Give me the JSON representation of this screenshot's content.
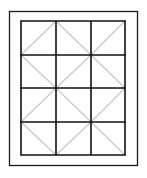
{
  "diagram": {
    "title": "",
    "outer_frame": {
      "x": 9,
      "y": 11,
      "w": 128,
      "h": 154
    },
    "grid": {
      "x": 21,
      "y": 21,
      "w": 104,
      "h": 134,
      "columns": 3,
      "rows": 4,
      "col_lines": [
        21,
        56,
        91,
        125
      ],
      "row_lines": [
        21,
        55,
        88,
        122,
        155
      ]
    },
    "diagonals": [
      {
        "x1": 21,
        "y1": 55,
        "x2": 56,
        "y2": 21
      },
      {
        "x1": 56,
        "y1": 21,
        "x2": 91,
        "y2": 55
      },
      {
        "x1": 91,
        "y1": 55,
        "x2": 125,
        "y2": 21
      },
      {
        "x1": 21,
        "y1": 55,
        "x2": 56,
        "y2": 88
      },
      {
        "x1": 56,
        "y1": 88,
        "x2": 91,
        "y2": 55
      },
      {
        "x1": 91,
        "y1": 55,
        "x2": 125,
        "y2": 88
      },
      {
        "x1": 21,
        "y1": 122,
        "x2": 56,
        "y2": 88
      },
      {
        "x1": 56,
        "y1": 88,
        "x2": 91,
        "y2": 122
      },
      {
        "x1": 91,
        "y1": 122,
        "x2": 125,
        "y2": 88
      },
      {
        "x1": 21,
        "y1": 122,
        "x2": 56,
        "y2": 155
      },
      {
        "x1": 56,
        "y1": 155,
        "x2": 91,
        "y2": 122
      },
      {
        "x1": 91,
        "y1": 122,
        "x2": 125,
        "y2": 155
      }
    ],
    "colors": {
      "frame": "#1a1a1a",
      "grid": "#111111",
      "diagonal": "#c8c8c8",
      "background": "#ffffff"
    }
  }
}
